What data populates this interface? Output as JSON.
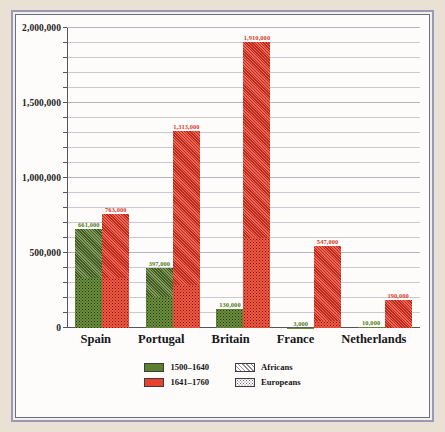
{
  "chart_data": {
    "type": "bar",
    "title": "",
    "subtitle": "",
    "xlabel": "",
    "ylabel": "",
    "ylim": [
      0,
      2000000
    ],
    "grid": true,
    "grid_step": 100000,
    "legend_position": "bottom-center",
    "categories": [
      "Spain",
      "Portugal",
      "Britain",
      "France",
      "Netherlands"
    ],
    "series": [
      {
        "name": "1500–1640",
        "color": "#5d8030",
        "values": [
          661000,
          397000,
          130000,
          3000,
          10000
        ],
        "labels": [
          "661,000",
          "397,000",
          "130,000",
          "3,000",
          "10,000"
        ],
        "composition": [
          {
            "africans": 330000,
            "europeans": 331000
          },
          {
            "africans": 190000,
            "europeans": 207000
          },
          {
            "africans": 0,
            "europeans": 130000
          },
          {
            "africans": 0,
            "europeans": 3000
          },
          {
            "africans": 0,
            "europeans": 10000
          }
        ]
      },
      {
        "name": "1641–1760",
        "color": "#e8412e",
        "values": [
          763000,
          1313000,
          1910000,
          547000,
          190000
        ],
        "labels": [
          "763,000",
          "1,313,000",
          "1,910,000",
          "547,000",
          "190,000"
        ],
        "composition": [
          {
            "africans": 430000,
            "europeans": 333000
          },
          {
            "africans": 1023000,
            "europeans": 290000
          },
          {
            "africans": 1310000,
            "europeans": 600000
          },
          {
            "africans": 497000,
            "europeans": 50000
          },
          {
            "africans": 190000,
            "europeans": 0
          }
        ]
      }
    ],
    "yticks": [
      {
        "value": 2000000,
        "label": "2,000,000",
        "major": true
      },
      {
        "value": 1900000,
        "label": "",
        "major": false
      },
      {
        "value": 1800000,
        "label": "",
        "major": false
      },
      {
        "value": 1700000,
        "label": "",
        "major": false
      },
      {
        "value": 1600000,
        "label": "",
        "major": false
      },
      {
        "value": 1500000,
        "label": "1,500,000",
        "major": true
      },
      {
        "value": 1400000,
        "label": "",
        "major": false
      },
      {
        "value": 1300000,
        "label": "",
        "major": false
      },
      {
        "value": 1200000,
        "label": "",
        "major": false
      },
      {
        "value": 1100000,
        "label": "",
        "major": false
      },
      {
        "value": 1000000,
        "label": "1,000,000",
        "major": true
      },
      {
        "value": 900000,
        "label": "",
        "major": false
      },
      {
        "value": 800000,
        "label": "",
        "major": false
      },
      {
        "value": 700000,
        "label": "",
        "major": false
      },
      {
        "value": 600000,
        "label": "",
        "major": false
      },
      {
        "value": 500000,
        "label": "500,000",
        "major": true
      },
      {
        "value": 400000,
        "label": "",
        "major": false
      },
      {
        "value": 300000,
        "label": "",
        "major": false
      },
      {
        "value": 200000,
        "label": "",
        "major": false
      },
      {
        "value": 100000,
        "label": "",
        "major": false
      },
      {
        "value": 0,
        "label": "0",
        "major": true
      }
    ],
    "legend": {
      "series_entries": [
        {
          "label": "1500–1640",
          "swatch": "green"
        },
        {
          "label": "1641–1760",
          "swatch": "red"
        }
      ],
      "pattern_entries": [
        {
          "label": "Africans",
          "swatch": "hatch"
        },
        {
          "label": "Europeans",
          "swatch": "dots"
        }
      ]
    }
  },
  "style": {
    "page_background": "#e8e1d4",
    "plot_background": "#fdfcfa",
    "frame_color": "#9a9ab4",
    "green": "#5d8030",
    "red": "#e8412e",
    "gridline": "#c9c9cf",
    "axis": "#55555f"
  }
}
